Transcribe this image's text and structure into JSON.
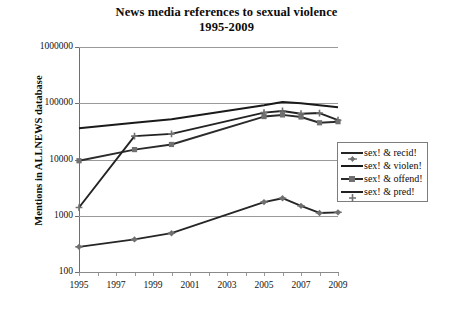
{
  "chart_data": {
    "type": "line",
    "title": "News media references to sexual violence 1995-2009",
    "title_line1": "News media references to sexual violence",
    "title_line2": "1995-2009",
    "xlabel": "",
    "ylabel": "Mentions in ALLNEWS database",
    "yscale": "log",
    "ylim": [
      100,
      1000000
    ],
    "ytick_labels": [
      "1000000",
      "100000",
      "10000",
      "1000",
      "100"
    ],
    "ytick_values": [
      1000000,
      100000,
      10000,
      1000,
      100
    ],
    "xlim": [
      1995,
      2009
    ],
    "xtick_labels": [
      "1995",
      "1997",
      "1999",
      "2001",
      "2003",
      "2005",
      "2007",
      "2009"
    ],
    "xtick_values": [
      1995,
      1997,
      1999,
      2001,
      2003,
      2005,
      2007,
      2009
    ],
    "grid": true,
    "legend_position": "right",
    "x": [
      1995,
      1998,
      2000,
      2005,
      2006,
      2007,
      2008,
      2009
    ],
    "series": [
      {
        "name": "sex! & recid!",
        "marker": "plus-diamond",
        "color": "#262626",
        "values": [
          280,
          380,
          490,
          1750,
          2050,
          1500,
          1120,
          1150
        ]
      },
      {
        "name": "sex! & violen!",
        "marker": "none",
        "color": "#1a1a1a",
        "values": [
          36000,
          45000,
          52000,
          92000,
          105000,
          100000,
          92000,
          85000
        ]
      },
      {
        "name": "sex! & offend!",
        "marker": "square",
        "color": "#2b2b2b",
        "values": [
          9500,
          15000,
          18500,
          58000,
          62000,
          57000,
          45000,
          47000
        ]
      },
      {
        "name": "sex! & pred!",
        "marker": "cross",
        "color": "#232323",
        "values": [
          1400,
          26000,
          28500,
          68000,
          73000,
          65000,
          67000,
          50000
        ]
      }
    ]
  },
  "legend": {
    "items": [
      {
        "label": "sex! & recid!"
      },
      {
        "label": "sex! & violen!"
      },
      {
        "label": "sex! & offend!"
      },
      {
        "label": "sex! & pred!"
      }
    ]
  },
  "colors": {
    "line": "#1e1e1e",
    "marker": "#707070",
    "grid": "#9a9a9a",
    "axis": "#6f6f6f",
    "text": "#111111",
    "background": "#ffffff"
  }
}
